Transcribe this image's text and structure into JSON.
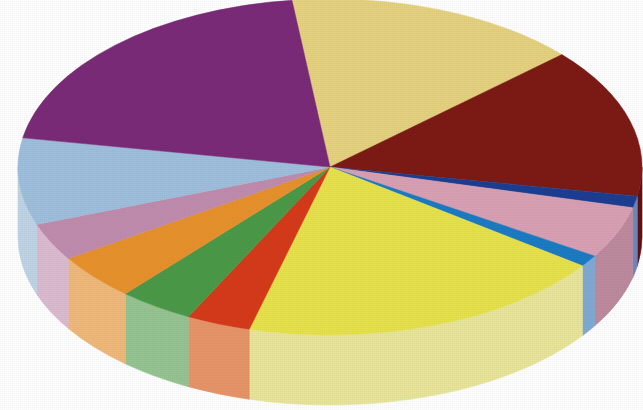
{
  "figure": {
    "kind": "3d-pie-chart",
    "background_color": "#FFFFFF",
    "has_title": false,
    "has_legend": false,
    "has_labels": false
  },
  "geometry": {
    "center_x": 330,
    "center_y": 167,
    "radius_x": 312,
    "radius_y": 168,
    "depth": 70,
    "start_angle_deg": -97
  },
  "chart_data": {
    "type": "pie",
    "title": "",
    "subtitle": "",
    "xlabel": "",
    "ylabel": "",
    "legend_position": "none",
    "grid": false,
    "labels_shown": false,
    "total_percent": 100,
    "categories": [
      "Slice 1",
      "Slice 2",
      "Slice 3",
      "Slice 4",
      "Slice 5",
      "Slice 6",
      "Slice 7",
      "Slice 8",
      "Slice 9",
      "Slice 10",
      "Slice 11",
      "Slice 12",
      "Slice 13"
    ],
    "values": [
      20.3,
      15.3,
      14.4,
      1.1,
      5.0,
      1.1,
      19.2,
      3.3,
      3.9,
      4.5,
      3.6,
      8.3,
      0.0
    ],
    "slices": [
      {
        "name": "Slice 1",
        "color_name": "khaki",
        "top_color": "#E5D27E",
        "side_color": "#C9B45F",
        "start_deg": -97,
        "end_deg": -42,
        "percent": 15.3
      },
      {
        "name": "Slice 2",
        "color_name": "dark-red",
        "top_color": "#7D1A14",
        "side_color": "#5E130F",
        "start_deg": -42,
        "end_deg": 10,
        "percent": 14.4
      },
      {
        "name": "Slice 3",
        "color_name": "navy-blue",
        "top_color": "#1C3E92",
        "side_color": "#6E87BE",
        "start_deg": 10,
        "end_deg": 14,
        "percent": 1.1
      },
      {
        "name": "Slice 4",
        "color_name": "pink",
        "top_color": "#D9A0B4",
        "side_color": "#BE8A9E",
        "start_deg": 14,
        "end_deg": 32,
        "percent": 5.0
      },
      {
        "name": "Slice 5",
        "color_name": "medium-blue",
        "top_color": "#1B7BC4",
        "side_color": "#7FAAD6",
        "start_deg": 32,
        "end_deg": 36,
        "percent": 1.1
      },
      {
        "name": "Slice 6",
        "color_name": "yellow",
        "top_color": "#E8E24A",
        "side_color": "#E9E69A",
        "start_deg": 36,
        "end_deg": 105,
        "percent": 19.2
      },
      {
        "name": "Slice 7",
        "color_name": "red-orange",
        "top_color": "#D63A18",
        "side_color": "#E89468",
        "start_deg": 105,
        "end_deg": 117,
        "percent": 3.3
      },
      {
        "name": "Slice 8",
        "color_name": "green",
        "top_color": "#4A9A47",
        "side_color": "#96C492",
        "start_deg": 117,
        "end_deg": 131,
        "percent": 3.9
      },
      {
        "name": "Slice 9",
        "color_name": "orange",
        "top_color": "#E8912C",
        "side_color": "#F0B979",
        "start_deg": 131,
        "end_deg": 147,
        "percent": 4.5
      },
      {
        "name": "Slice 10",
        "color_name": "mauve-pink",
        "top_color": "#C08CAE",
        "side_color": "#DCBBD0",
        "start_deg": 147,
        "end_deg": 160,
        "percent": 3.6
      },
      {
        "name": "Slice 11",
        "color_name": "light-blue",
        "top_color": "#9EBFDD",
        "side_color": "#BFD4E6",
        "start_deg": 160,
        "end_deg": 190,
        "percent": 8.3
      },
      {
        "name": "Slice 12",
        "color_name": "purple",
        "top_color": "#7B2A78",
        "side_color": "#9A6D92",
        "start_deg": 190,
        "end_deg": 263,
        "percent": 20.3
      }
    ],
    "palette": [
      "#E5D27E",
      "#7D1A14",
      "#1C3E92",
      "#D9A0B4",
      "#1B7BC4",
      "#E8E24A",
      "#D63A18",
      "#4A9A47",
      "#E8912C",
      "#C08CAE",
      "#9EBFDD",
      "#7B2A78"
    ]
  }
}
